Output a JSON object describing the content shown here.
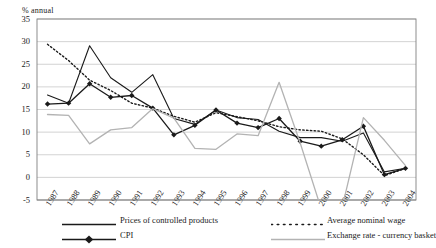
{
  "chart_data": {
    "type": "line",
    "title": "",
    "xlabel": "",
    "ylabel": "% annual",
    "ylim": [
      -5,
      35
    ],
    "ystep": 5,
    "grid": true,
    "legend_position": "bottom",
    "yticks": [
      "35",
      "30",
      "25",
      "20",
      "15",
      "10",
      "5",
      "0",
      "-5"
    ],
    "categories": [
      "1987",
      "1988",
      "1989",
      "1990",
      "1991",
      "1992",
      "1993",
      "1994",
      "1995",
      "1996",
      "1997",
      "1998",
      "1999",
      "2000",
      "2001",
      "2002",
      "2003",
      "2004"
    ],
    "series": [
      {
        "name": "Prices of controlled products",
        "style": "solid-black",
        "values": [
          18.2,
          16.4,
          29.1,
          22.0,
          18.8,
          22.7,
          13.0,
          11.7,
          14.9,
          13.2,
          12.8,
          10.2,
          8.8,
          8.8,
          8.0,
          9.8,
          1.2,
          2.0
        ]
      },
      {
        "name": "CPI",
        "style": "solid-black-diamond",
        "values": [
          16.2,
          16.4,
          20.7,
          17.7,
          18.1,
          15.3,
          9.4,
          11.5,
          14.9,
          12.0,
          11.0,
          13.0,
          8.0,
          6.9,
          8.3,
          11.3,
          0.6,
          2.0
        ]
      },
      {
        "name": "Average nominal wage",
        "style": "dotted-black",
        "values": [
          29.4,
          25.8,
          21.5,
          19.2,
          16.4,
          15.3,
          13.5,
          12.2,
          14.3,
          13.4,
          12.5,
          11.2,
          10.5,
          10.2,
          8.5,
          5.0,
          0.4,
          2.0
        ]
      },
      {
        "name": "Exchange rate - currency basket",
        "style": "solid-grey",
        "values": [
          13.9,
          13.7,
          7.4,
          10.5,
          11.0,
          15.2,
          13.1,
          6.4,
          6.2,
          9.6,
          9.2,
          21.0,
          7.6,
          -7.0,
          -6.5,
          13.2,
          8.2,
          2.6
        ]
      }
    ]
  },
  "legend": {
    "items": [
      {
        "label": "Prices of controlled products",
        "swatch": "solid-black-line-icon"
      },
      {
        "label": "CPI",
        "swatch": "black-diamond-line-icon"
      },
      {
        "label": "Average nominal wage",
        "swatch": "dotted-line-icon"
      },
      {
        "label": "Exchange rate - currency basket",
        "swatch": "grey-line-icon"
      }
    ]
  },
  "colors": {
    "series_black": "#1a1a1a",
    "series_grey": "#b3b3b3",
    "grid": "#c8c8c8",
    "axis": "#808080",
    "background": "#ffffff"
  }
}
